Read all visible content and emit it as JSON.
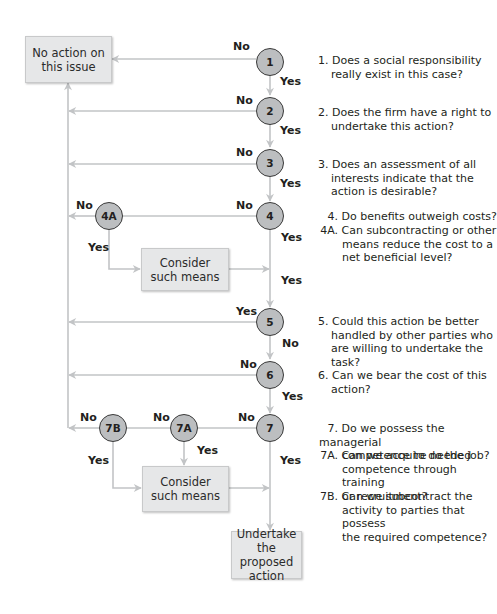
{
  "diagram": {
    "type": "decision-flowchart",
    "colors": {
      "line": "#c2c4c6",
      "node_fill": "#bcbec0",
      "node_border": "#3a3a3a",
      "box_fill": "#e6e7e8",
      "text": "#231f20"
    },
    "boxes": {
      "no_action": "No action on this issue",
      "no_action_l1": "No action on",
      "no_action_l2": "this issue",
      "consider_1_l1": "Consider",
      "consider_1_l2": "such means",
      "consider_2_l1": "Consider",
      "consider_2_l2": "such means",
      "undertake_l1": "Undertake",
      "undertake_l2": "the proposed",
      "undertake_l3": "action"
    },
    "nodes": {
      "n1": "1",
      "n2": "2",
      "n3": "3",
      "n4": "4",
      "n4a": "4A",
      "n5": "5",
      "n6": "6",
      "n7": "7",
      "n7a": "7A",
      "n7b": "7B"
    },
    "edge_labels": {
      "n1_no": "No",
      "n1_yes": "Yes",
      "n2_no": "No",
      "n2_yes": "Yes",
      "n3_no": "No",
      "n3_yes": "Yes",
      "n4_no": "No",
      "n4_yes": "Yes",
      "n4a_no": "No",
      "n4a_yes": "Yes",
      "consider1_yes": "Yes",
      "n5_yes": "Yes",
      "n5_no": "No",
      "n6_no": "No",
      "n6_yes": "Yes",
      "n7_no": "No",
      "n7_yes": "Yes",
      "n7a_no": "No",
      "n7a_yes": "Yes",
      "n7b_no": "No",
      "n7b_yes": "Yes"
    },
    "questions": [
      {
        "num": "1.",
        "lines": [
          "Does a social responsibility",
          "really exist in this case?"
        ]
      },
      {
        "num": "2.",
        "lines": [
          "Does the firm have a right to",
          "undertake this action?"
        ]
      },
      {
        "num": "3.",
        "lines": [
          "Does an assessment of all",
          "interests indicate that the",
          "action is desirable?"
        ]
      },
      {
        "num": "4.",
        "lines": [
          "Do benefits outweigh costs?"
        ]
      },
      {
        "num": "4A.",
        "lines": [
          "Can subcontracting or other",
          "means reduce the cost to a",
          "net beneficial level?"
        ]
      },
      {
        "num": "5.",
        "lines": [
          "Could this action be better",
          "handled by other parties who",
          "are willing to undertake the",
          "task?"
        ]
      },
      {
        "num": "6.",
        "lines": [
          "Can we bear the cost of this",
          "action?"
        ]
      },
      {
        "num": "7.",
        "lines": [
          "Do we possess the managerial",
          "competence to do the job?"
        ]
      },
      {
        "num": "7A.",
        "lines": [
          "Can we acquire needed",
          "competence through training",
          "or recruitment?"
        ]
      },
      {
        "num": "7B.",
        "lines": [
          "Can we subcontract the",
          "activity to parties that possess",
          "the required competence?"
        ]
      }
    ]
  }
}
